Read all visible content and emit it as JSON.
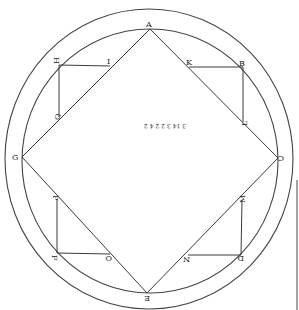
{
  "diagram": {
    "stroke_color": "#3a3a3a",
    "outer_circle": {
      "cx": 149,
      "cy": 159,
      "rx": 144,
      "ry": 150
    },
    "inner_circle": {
      "cx": 150,
      "cy": 161,
      "rx": 128,
      "ry": 132
    },
    "square": {
      "vertices": {
        "A": {
          "x": 150,
          "y": 29,
          "label": "A"
        },
        "C": {
          "x": 278,
          "y": 158,
          "label": "C"
        },
        "E": {
          "x": 147,
          "y": 293,
          "label": "E"
        },
        "G": {
          "x": 22,
          "y": 157,
          "label": "G"
        }
      }
    },
    "corner_figures": [
      {
        "corner": "H",
        "points": {
          "H": [
            59,
            65
          ],
          "I": [
            110,
            66
          ],
          "Q": [
            59,
            117
          ]
        }
      },
      {
        "corner": "B",
        "points": {
          "B": [
            243,
            67
          ],
          "K": [
            189,
            67
          ],
          "L": [
            243,
            122
          ]
        }
      },
      {
        "corner": "F",
        "points": {
          "F": [
            57,
            253
          ],
          "O": [
            110,
            254
          ],
          "P": [
            57,
            199
          ]
        }
      },
      {
        "corner": "D",
        "points": {
          "D": [
            241,
            255
          ],
          "N": [
            188,
            255
          ],
          "M": [
            242,
            200
          ]
        }
      }
    ],
    "labels": {
      "A": "A",
      "B": "B",
      "C": "C",
      "D": "D",
      "E": "E",
      "F": "F",
      "G": "G",
      "H": "H",
      "I": "I",
      "K": "K",
      "L": "L",
      "M": "M",
      "N": "N",
      "O": "O",
      "P": "P",
      "Q": "Q"
    },
    "center_note": "3 14 3 2 2 4 2"
  }
}
